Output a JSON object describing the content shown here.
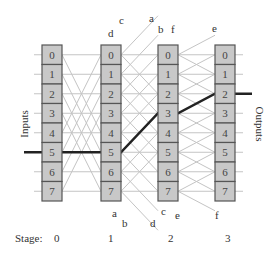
{
  "diagram": {
    "side_labels": {
      "inputs": "Inputs",
      "outputs": "Outputs"
    },
    "stage_label": "Stage:",
    "stages": [
      "0",
      "1",
      "2",
      "3"
    ],
    "switch_cells": [
      "0",
      "1",
      "2",
      "3",
      "4",
      "5",
      "6",
      "7"
    ],
    "wire_labels_top": [
      "d",
      "c",
      "a",
      "b",
      "f",
      "e"
    ],
    "wire_labels_bottom": [
      "a",
      "b",
      "d",
      "c",
      "e",
      "f"
    ],
    "highlighted_path": {
      "input": "5",
      "output": "2"
    },
    "colors": {
      "cell_fill": "#c8c8c8",
      "cell_border": "#555555",
      "wire": "#c4c4c4",
      "path": "#222222"
    }
  }
}
